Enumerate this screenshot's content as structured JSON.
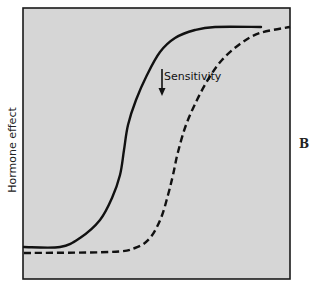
{
  "figure": {
    "panel_label": "B",
    "y_axis_label": "Hormone effect",
    "annotation": {
      "text": "Sensitivity",
      "arrow_direction": "down"
    },
    "colors": {
      "plot_background": "#d6d6d6",
      "frame": "#1a1a1a",
      "curve": "#111111"
    },
    "curves": [
      {
        "name": "normal",
        "style": "solid",
        "points": [
          [
            24,
            247
          ],
          [
            60,
            247
          ],
          [
            80,
            238
          ],
          [
            100,
            220
          ],
          [
            112,
            198
          ],
          [
            120,
            175
          ],
          [
            124,
            150
          ],
          [
            128,
            125
          ],
          [
            136,
            100
          ],
          [
            147,
            75
          ],
          [
            160,
            52
          ],
          [
            175,
            38
          ],
          [
            195,
            30
          ],
          [
            215,
            27
          ],
          [
            261,
            27
          ]
        ]
      },
      {
        "name": "decreased-sensitivity",
        "style": "dashed",
        "points": [
          [
            24,
            253
          ],
          [
            110,
            252
          ],
          [
            135,
            248
          ],
          [
            150,
            238
          ],
          [
            161,
            218
          ],
          [
            168,
            195
          ],
          [
            173,
            175
          ],
          [
            178,
            152
          ],
          [
            186,
            125
          ],
          [
            197,
            100
          ],
          [
            209,
            78
          ],
          [
            222,
            60
          ],
          [
            240,
            44
          ],
          [
            260,
            33
          ],
          [
            290,
            27
          ]
        ]
      }
    ]
  }
}
